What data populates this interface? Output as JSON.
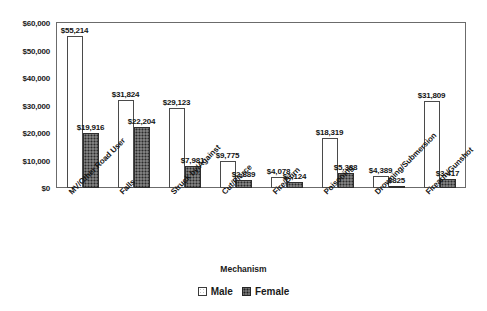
{
  "chart_data": {
    "type": "bar",
    "title": "",
    "xlabel": "Mechanism",
    "ylabel": "",
    "ylim": [
      0,
      60000
    ],
    "ytick_labels": [
      "$60,000",
      "$50,000",
      "$40,000",
      "$30,000",
      "$20,000",
      "$10,000",
      "$0"
    ],
    "ytick_values": [
      60000,
      50000,
      40000,
      30000,
      20000,
      10000,
      0
    ],
    "grid": false,
    "legend_position": "bottom",
    "categories": [
      "MV/Other Road User",
      "Falls",
      "Struck by/Against",
      "Cut/Pierce",
      "Fire/Burn",
      "Poisoning",
      "Drowning/Submersion",
      "Firearm/Gunshot"
    ],
    "series": [
      {
        "name": "Male",
        "values": [
          55214,
          31824,
          29123,
          9775,
          4078,
          18319,
          4389,
          31809
        ],
        "labels": [
          "$55,214",
          "$31,824",
          "$29,123",
          "$9,775",
          "$4,078",
          "$18,319",
          "$4,389",
          "$31,809"
        ]
      },
      {
        "name": "Female",
        "values": [
          19916,
          22204,
          7981,
          2889,
          2124,
          5388,
          825,
          3417
        ],
        "labels": [
          "$19,916",
          "$22,204",
          "$7,981",
          "$2,889",
          "$2,124",
          "$5,388",
          "$825",
          "$3,417"
        ]
      }
    ]
  },
  "legend": {
    "items": [
      {
        "label": "Male"
      },
      {
        "label": "Female"
      }
    ]
  },
  "colors": {
    "male_fill": "#ffffff",
    "female_fill": "#5a5a5a",
    "axis": "#6b6b6b",
    "text": "#141414"
  }
}
